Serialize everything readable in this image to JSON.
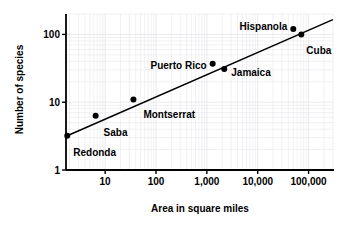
{
  "chart_data": {
    "type": "scatter",
    "title": "",
    "xlabel": "Area in square miles",
    "ylabel": "Number of species",
    "xscale": "log",
    "yscale": "log",
    "xlim": [
      1.7,
      316000
    ],
    "ylim": [
      1,
      200
    ],
    "grid": "minor-log-both",
    "legend": "none",
    "xticklabels": [
      "10",
      "100",
      "1,000",
      "10,000",
      "100,000"
    ],
    "xtickvalues": [
      10,
      100,
      1000,
      10000,
      100000
    ],
    "yticklabels": [
      "1",
      "10",
      "100"
    ],
    "ytickvalues": [
      1,
      10,
      100
    ],
    "points": [
      {
        "name": "Redonda",
        "x": 1.8,
        "y": 3.2,
        "label_dx": 6,
        "label_dy": 17,
        "label_anchor": "start"
      },
      {
        "name": "Saba",
        "x": 6.5,
        "y": 6.3,
        "label_dx": 8,
        "label_dy": 17,
        "label_anchor": "start"
      },
      {
        "name": "Montserrat",
        "x": 36,
        "y": 11,
        "label_dx": 10,
        "label_dy": 16,
        "label_anchor": "start"
      },
      {
        "name": "Puerto Rico",
        "x": 1300,
        "y": 37,
        "label_dx": -6,
        "label_dy": 2,
        "label_anchor": "end"
      },
      {
        "name": "Jamaica",
        "x": 2200,
        "y": 31,
        "label_dx": 7,
        "label_dy": 4,
        "label_anchor": "start"
      },
      {
        "name": "Hispanola",
        "x": 50000,
        "y": 120,
        "label_dx": -6,
        "label_dy": -2,
        "label_anchor": "end"
      },
      {
        "name": "Cuba",
        "x": 72000,
        "y": 100,
        "label_dx": 5,
        "label_dy": 17,
        "label_anchor": "start"
      }
    ],
    "trendline": {
      "x0": 1.8,
      "y0": 3.2,
      "x1": 300000,
      "y1": 165
    }
  },
  "style": {
    "axis_color": "#000000",
    "grid_color": "#e8e8ec",
    "point_color": "#000000",
    "line_color": "#000000",
    "background": "#ffffff"
  }
}
